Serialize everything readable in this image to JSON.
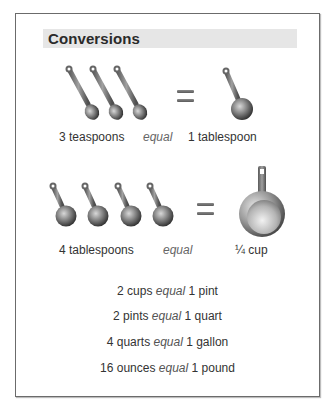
{
  "card": {
    "title": "Conversions",
    "equal_word": "equal",
    "row1": {
      "left_qty": "3 teaspoons",
      "right_qty": "1 tablespoon",
      "left_icon": "teaspoon-icon",
      "left_count": 3,
      "right_icon": "tablespoon-icon"
    },
    "row2": {
      "left_qty": "4 tablespoons",
      "right_qty": "¼ cup",
      "left_icon": "tablespoon-icon",
      "left_count": 4,
      "right_icon": "measuring-cup-icon"
    },
    "facts": [
      {
        "left": "2 cups",
        "right": "1 pint"
      },
      {
        "left": "2 pints",
        "right": "1 quart"
      },
      {
        "left": "4 quarts",
        "right": "1 gallon"
      },
      {
        "left": "16 ounces",
        "right": "1 pound"
      }
    ]
  },
  "colors": {
    "frame_border": "#6b6b6b",
    "header_bg": "#e6e6e6",
    "text": "#333333"
  }
}
